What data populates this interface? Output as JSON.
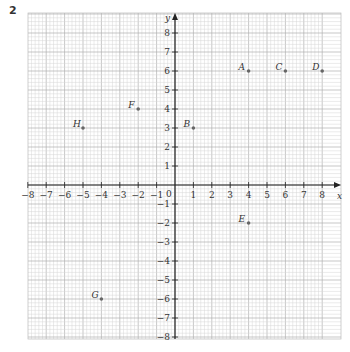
{
  "question_number": "2",
  "chart_data": {
    "type": "scatter",
    "title": "",
    "xlabel": "x",
    "ylabel": "y",
    "xlim": [
      -8,
      8
    ],
    "ylim": [
      -8,
      8
    ],
    "grid": true,
    "x_ticks": [
      -8,
      -7,
      -6,
      -5,
      -4,
      -3,
      -2,
      -1,
      1,
      2,
      3,
      4,
      5,
      6,
      7,
      8
    ],
    "y_ticks": [
      -8,
      -7,
      -6,
      -5,
      -4,
      -3,
      -2,
      -1,
      1,
      2,
      3,
      4,
      5,
      6,
      7,
      8
    ],
    "origin_label": "0",
    "points": [
      {
        "label": "A",
        "x": 4,
        "y": 6
      },
      {
        "label": "B",
        "x": 1,
        "y": 3
      },
      {
        "label": "C",
        "x": 6,
        "y": 6
      },
      {
        "label": "D",
        "x": 8,
        "y": 6
      },
      {
        "label": "E",
        "x": 4,
        "y": -2
      },
      {
        "label": "F",
        "x": -2,
        "y": 4
      },
      {
        "label": "G",
        "x": -4,
        "y": -6
      },
      {
        "label": "H",
        "x": -5,
        "y": 3
      }
    ]
  }
}
